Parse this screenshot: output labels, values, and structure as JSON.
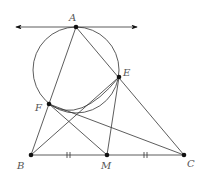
{
  "diagram": {
    "type": "geometry",
    "points": {
      "A": {
        "label": "A",
        "x": 76,
        "y": 27
      },
      "E": {
        "label": "E",
        "x": 119,
        "y": 77
      },
      "F": {
        "label": "F",
        "x": 49,
        "y": 104
      },
      "B": {
        "label": "B",
        "x": 31,
        "y": 155
      },
      "M": {
        "label": "M",
        "x": 107,
        "y": 155
      },
      "C": {
        "label": "C",
        "x": 184,
        "y": 155
      }
    },
    "circle": {
      "cx": 76,
      "cy": 70,
      "r": 43
    },
    "tangent_line": {
      "through": "A",
      "from_x": 15,
      "to_x": 138
    },
    "segments": [
      [
        "A",
        "B"
      ],
      [
        "A",
        "C"
      ],
      [
        "B",
        "C"
      ],
      [
        "B",
        "E"
      ],
      [
        "F",
        "M"
      ],
      [
        "F",
        "C"
      ],
      [
        "E",
        "M"
      ]
    ],
    "tick_marks": [
      "BM",
      "MC"
    ],
    "labels": [
      "A",
      "E",
      "F",
      "B",
      "M",
      "C"
    ]
  }
}
